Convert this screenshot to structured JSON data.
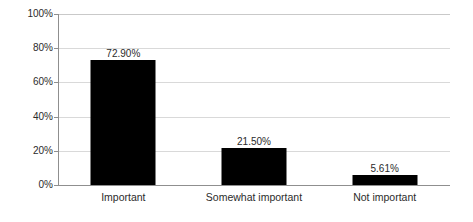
{
  "chart_data": {
    "type": "bar",
    "title": "",
    "subtitle": "",
    "xlabel": "",
    "ylabel": "",
    "categories": [
      "Important",
      "Somewhat important",
      "Not important"
    ],
    "values": [
      72.9,
      21.5,
      5.61
    ],
    "data_labels": [
      "72.90%",
      "21.50%",
      "5.61%"
    ],
    "ylim": [
      0,
      100
    ],
    "y_ticks": [
      0,
      20,
      40,
      60,
      80,
      100
    ],
    "y_tick_labels": [
      "0%",
      "20%",
      "40%",
      "60%",
      "80%",
      "100%"
    ],
    "grid": true,
    "grid_axis": "y",
    "legend": false,
    "legend_position": "none",
    "series": [
      {
        "name": "",
        "values": [
          72.9,
          21.5,
          5.61
        ],
        "color": "#000000"
      }
    ],
    "colors": {
      "bar": "#000000",
      "gridline": "#d9d9d9",
      "axis": "#8f8f8f",
      "text": "#2b2b2b",
      "background": "#ffffff"
    }
  }
}
